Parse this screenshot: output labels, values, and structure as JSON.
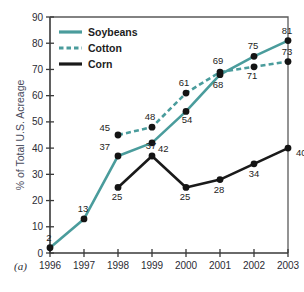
{
  "chart_data": {
    "type": "line",
    "title": "",
    "panel_label": "(a)",
    "xlabel": "",
    "ylabel": "% of Total U.S. Acreage",
    "categories": [
      "1996",
      "1997",
      "1998",
      "1999",
      "2000",
      "2001",
      "2002",
      "2003"
    ],
    "x": [
      1996,
      1997,
      1998,
      1999,
      2000,
      2001,
      2002,
      2003
    ],
    "ylim": [
      0,
      90
    ],
    "yticks": [
      0,
      10,
      20,
      30,
      40,
      50,
      60,
      70,
      80,
      90
    ],
    "ytick_labels": [
      "0",
      "10",
      "20",
      "30",
      "40",
      "50",
      "60",
      "70",
      "80",
      "90"
    ],
    "grid": false,
    "legend_position": "upper-left-inside",
    "series": [
      {
        "name": "Soybeans",
        "style": "solid",
        "color": "#4a9c9c",
        "values": [
          2,
          13,
          37,
          42,
          54,
          68,
          75,
          81
        ],
        "labels": [
          "2",
          "13",
          "37",
          "42",
          "54",
          "68",
          "75",
          "81"
        ]
      },
      {
        "name": "Cotton",
        "style": "dashed",
        "color": "#4a9c9c",
        "values": [
          null,
          null,
          45,
          48,
          61,
          69,
          71,
          73
        ],
        "labels": [
          null,
          null,
          "45",
          "48",
          "61",
          "69",
          "71",
          "73"
        ]
      },
      {
        "name": "Corn",
        "style": "solid",
        "color": "#1a1a1a",
        "values": [
          null,
          null,
          25,
          37,
          25,
          28,
          34,
          40
        ],
        "labels": [
          null,
          null,
          "25",
          "37",
          "25",
          "28",
          "34",
          "40"
        ]
      }
    ]
  },
  "legend": {
    "items": [
      {
        "label": "Soybeans",
        "style": "solid",
        "color": "#4a9c9c"
      },
      {
        "label": "Cotton",
        "style": "dashed",
        "color": "#4a9c9c"
      },
      {
        "label": "Corn",
        "style": "solid",
        "color": "#1a1a1a"
      }
    ]
  },
  "colors": {
    "teal": "#4a9c9c",
    "black": "#1a1a1a",
    "axis": "#3a3a3a",
    "ylabel": "#484a5c",
    "background": "#ffffff"
  }
}
